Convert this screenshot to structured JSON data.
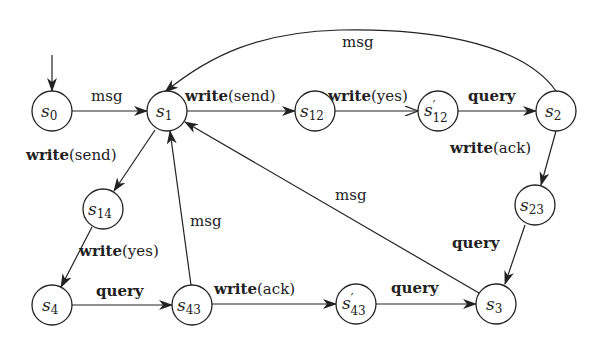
{
  "diagram": {
    "type": "state-machine",
    "nodes": [
      {
        "id": "s0",
        "base": "s",
        "prime": "",
        "sub": "0",
        "x": 52,
        "y": 111,
        "initial": true
      },
      {
        "id": "s1",
        "base": "s",
        "prime": "",
        "sub": "1",
        "x": 167,
        "y": 111
      },
      {
        "id": "s12",
        "base": "s",
        "prime": "",
        "sub": "12",
        "x": 315,
        "y": 111
      },
      {
        "id": "s12p",
        "base": "s",
        "prime": "′",
        "sub": "12",
        "x": 438,
        "y": 111
      },
      {
        "id": "s2",
        "base": "s",
        "prime": "",
        "sub": "2",
        "x": 556,
        "y": 111
      },
      {
        "id": "s14",
        "base": "s",
        "prime": "",
        "sub": "14",
        "x": 103,
        "y": 209
      },
      {
        "id": "s23",
        "base": "s",
        "prime": "",
        "sub": "23",
        "x": 535,
        "y": 205
      },
      {
        "id": "s4",
        "base": "s",
        "prime": "",
        "sub": "4",
        "x": 52,
        "y": 305
      },
      {
        "id": "s43",
        "base": "s",
        "prime": "",
        "sub": "43",
        "x": 192,
        "y": 305
      },
      {
        "id": "s43p",
        "base": "s",
        "prime": "′",
        "sub": "43",
        "x": 356,
        "y": 304
      },
      {
        "id": "s3",
        "base": "s",
        "prime": "",
        "sub": "3",
        "x": 496,
        "y": 304
      }
    ],
    "edges": [
      {
        "from": "s0",
        "to": "s1",
        "kw": "",
        "label": "msg"
      },
      {
        "from": "s1",
        "to": "s12",
        "kw": "write",
        "label": "(send)"
      },
      {
        "from": "s12",
        "to": "s12p",
        "kw": "write",
        "label": "(yes)"
      },
      {
        "from": "s12p",
        "to": "s2",
        "kw": "query",
        "label": ""
      },
      {
        "from": "s2",
        "to": "s1",
        "kw": "",
        "label": "msg"
      },
      {
        "from": "s2",
        "to": "s23",
        "kw": "write",
        "label": "(ack)"
      },
      {
        "from": "s23",
        "to": "s3",
        "kw": "query",
        "label": ""
      },
      {
        "from": "s3",
        "to": "s1",
        "kw": "",
        "label": "msg"
      },
      {
        "from": "s1",
        "to": "s14",
        "kw": "write",
        "label": "(send)"
      },
      {
        "from": "s14",
        "to": "s4",
        "kw": "write",
        "label": "(yes)"
      },
      {
        "from": "s4",
        "to": "s43",
        "kw": "query",
        "label": ""
      },
      {
        "from": "s43",
        "to": "s1",
        "kw": "",
        "label": "msg"
      },
      {
        "from": "s43",
        "to": "s43p",
        "kw": "write",
        "label": "(ack)"
      },
      {
        "from": "s43p",
        "to": "s3",
        "kw": "query",
        "label": ""
      }
    ]
  }
}
